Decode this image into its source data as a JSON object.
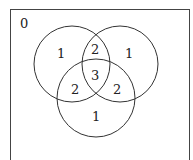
{
  "diagram": {
    "type": "venn",
    "universe_label": "0",
    "regions": {
      "A_only": "1",
      "B_only": "1",
      "C_only": "1",
      "A_and_B": "2",
      "A_and_C": "2",
      "B_and_C": "2",
      "A_and_B_and_C": "3"
    }
  }
}
